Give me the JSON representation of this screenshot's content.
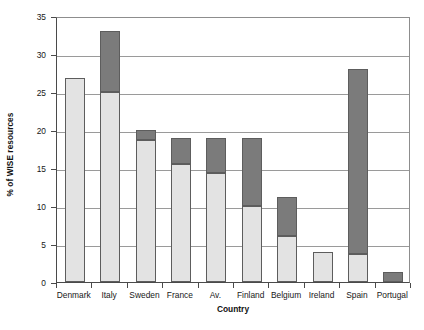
{
  "chart_data": {
    "type": "bar",
    "title": "",
    "xlabel": "Country",
    "ylabel": "% of WISE resources",
    "ylim": [
      0,
      35
    ],
    "ytick_step": 5,
    "yticks": [
      0,
      5,
      10,
      15,
      20,
      25,
      30,
      35
    ],
    "grid": "horizontal",
    "legend": "none",
    "stacked": true,
    "categories": [
      "Denmark",
      "Italy",
      "Sweden",
      "France",
      "Av.",
      "Finland",
      "Belgium",
      "Ireland",
      "Spain",
      "Portugal"
    ],
    "series": [
      {
        "name": "light-segment",
        "color": "#e3e3e3",
        "values": [
          26.9,
          25.0,
          18.7,
          15.5,
          14.3,
          10.0,
          6.0,
          3.9,
          3.7,
          0.0
        ]
      },
      {
        "name": "dark-segment",
        "color": "#7b7b7b",
        "values": [
          0.0,
          8.0,
          1.3,
          3.5,
          4.7,
          9.0,
          5.2,
          0.0,
          24.3,
          1.3
        ]
      }
    ],
    "totals": [
      26.9,
      33.0,
      20.0,
      19.0,
      19.0,
      19.0,
      11.2,
      3.9,
      28.0,
      1.3
    ]
  },
  "axis": {
    "y_title": "% of WISE resources",
    "x_title": "Country",
    "y_tick_labels": [
      "0",
      "5",
      "10",
      "15",
      "20",
      "25",
      "30",
      "35"
    ]
  },
  "colors": {
    "light_segment": "#e3e3e3",
    "dark_segment": "#7b7b7b",
    "bar_outline": "#5d5d5d",
    "gridline": "#9a9a9a",
    "axis": "#4a4a4a",
    "background": "#ffffff"
  }
}
